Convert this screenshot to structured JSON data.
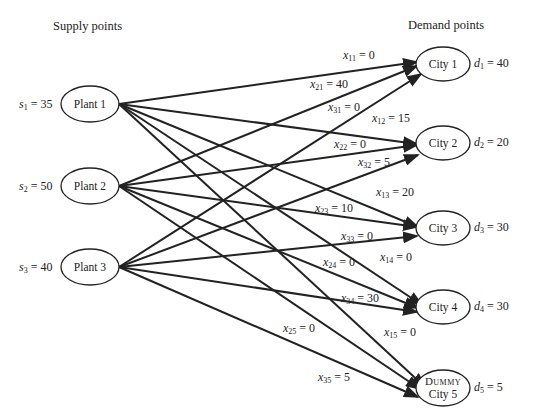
{
  "headers": {
    "supply": "Supply points",
    "demand": "Demand points"
  },
  "plants": [
    {
      "label": "Plant 1",
      "supply_var": "s",
      "supply_sub": "1",
      "supply": "35"
    },
    {
      "label": "Plant 2",
      "supply_var": "s",
      "supply_sub": "2",
      "supply": "50"
    },
    {
      "label": "Plant 3",
      "supply_var": "s",
      "supply_sub": "3",
      "supply": "40"
    }
  ],
  "cities": [
    {
      "label": "City 1",
      "demand_var": "d",
      "demand_sub": "1",
      "demand": "40"
    },
    {
      "label": "City 2",
      "demand_var": "d",
      "demand_sub": "2",
      "demand": "20"
    },
    {
      "label": "City 3",
      "demand_var": "d",
      "demand_sub": "3",
      "demand": "30"
    },
    {
      "label": "City 4",
      "demand_var": "d",
      "demand_sub": "4",
      "demand": "30"
    },
    {
      "label_top": "Dummy",
      "label": "City 5",
      "demand_var": "d",
      "demand_sub": "5",
      "demand": "5"
    }
  ],
  "flows": [
    {
      "var": "x",
      "sub": "11",
      "value": "0"
    },
    {
      "var": "x",
      "sub": "21",
      "value": "40"
    },
    {
      "var": "x",
      "sub": "31",
      "value": "0"
    },
    {
      "var": "x",
      "sub": "12",
      "value": "15"
    },
    {
      "var": "x",
      "sub": "22",
      "value": "0"
    },
    {
      "var": "x",
      "sub": "32",
      "value": "5"
    },
    {
      "var": "x",
      "sub": "13",
      "value": "20"
    },
    {
      "var": "x",
      "sub": "23",
      "value": "10"
    },
    {
      "var": "x",
      "sub": "33",
      "value": "0"
    },
    {
      "var": "x",
      "sub": "24",
      "value": "0"
    },
    {
      "var": "x",
      "sub": "14",
      "value": "0"
    },
    {
      "var": "x",
      "sub": "34",
      "value": "30"
    },
    {
      "var": "x",
      "sub": "25",
      "value": "0"
    },
    {
      "var": "x",
      "sub": "15",
      "value": "0"
    },
    {
      "var": "x",
      "sub": "35",
      "value": "5"
    }
  ]
}
